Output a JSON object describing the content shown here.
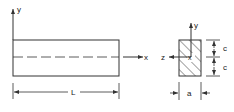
{
  "diagram": {
    "beam_view": {
      "axis_y_label": "y",
      "axis_x_label": "x",
      "length_label": "L"
    },
    "cross_section": {
      "axis_y_label": "y",
      "axis_z_label": "z",
      "origin_label": "x",
      "half_height_label_top": "c",
      "half_height_label_bottom": "c",
      "width_label": "a"
    },
    "colors": {
      "line": "#333333",
      "background": "#ffffff"
    }
  }
}
